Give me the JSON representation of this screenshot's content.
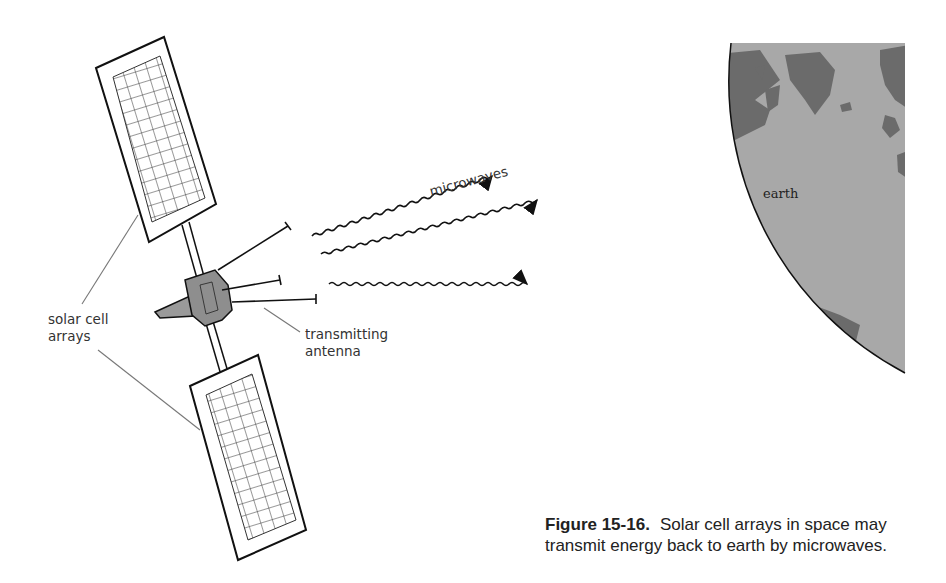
{
  "figure": {
    "number": "Figure 15-16.",
    "caption_line1": "Solar cell arrays in space may",
    "caption_line2": "transmit energy back to earth by microwaves."
  },
  "labels": {
    "solar_cell_line1": "solar cell",
    "solar_cell_line2": "arrays",
    "antenna_line1": "transmitting",
    "antenna_line2": "antenna",
    "microwaves": "microwaves",
    "earth": "earth"
  },
  "colors": {
    "ink": "#111111",
    "leader": "#777777",
    "ocean": "#a8a8a8",
    "land": "#6b6b6b",
    "satellite_body": "#9a9a9a"
  }
}
